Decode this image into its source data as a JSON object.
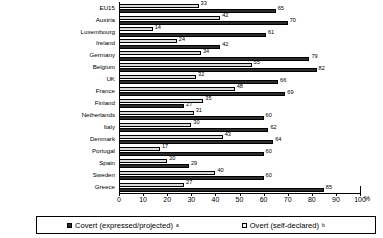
{
  "chart_data": {
    "type": "bar",
    "orientation": "horizontal",
    "title": "",
    "xlabel": "%",
    "ylabel": "",
    "xlim": [
      0,
      100
    ],
    "xticks": [
      0,
      10,
      20,
      30,
      40,
      50,
      60,
      70,
      80,
      90,
      100
    ],
    "grid": false,
    "legend_position": "bottom",
    "categories": [
      "EU15",
      "Austria",
      "Luxembourg",
      "Ireland",
      "Germany",
      "Belgium",
      "UK",
      "France",
      "Finland",
      "Netherlands",
      "Italy",
      "Denmark",
      "Portugal",
      "Spain",
      "Sweden",
      "Greece"
    ],
    "series": [
      {
        "name": "Covert (expressed/projected)",
        "color": "#2b2b2b",
        "values": [
          65,
          70,
          61,
          42,
          79,
          82,
          66,
          69,
          27,
          60,
          62,
          64,
          60,
          29,
          60,
          85
        ]
      },
      {
        "name": "Overt (self-declared)",
        "color": "#dcdcdc",
        "values": [
          33,
          42,
          14,
          24,
          34,
          55,
          32,
          48,
          35,
          31,
          30,
          43,
          17,
          20,
          40,
          27
        ]
      }
    ]
  },
  "axis": {
    "tick_labels": [
      "0",
      "10",
      "20",
      "30",
      "40",
      "50",
      "60",
      "70",
      "80",
      "90",
      "100"
    ],
    "unit": "%"
  },
  "legend": {
    "items": [
      {
        "label": "Covert (expressed/projected)",
        "superscript": "a",
        "swatch": "filled-dark-square"
      },
      {
        "label": "Overt (self-declared)",
        "superscript": "b",
        "swatch": "open-light-square"
      }
    ]
  }
}
